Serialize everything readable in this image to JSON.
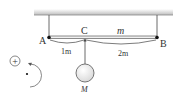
{
  "diagram": {
    "labels": {
      "point_a": "A",
      "point_b": "B",
      "point_c": "C",
      "bar_mass": "m",
      "hanging_mass": "M",
      "dist_ac": "1m",
      "dist_cb": "2m",
      "sign_convention": "+"
    },
    "colors": {
      "ceiling": "#c8c8c8",
      "line": "#444444",
      "ball_fill": "#f4f4f4"
    }
  }
}
